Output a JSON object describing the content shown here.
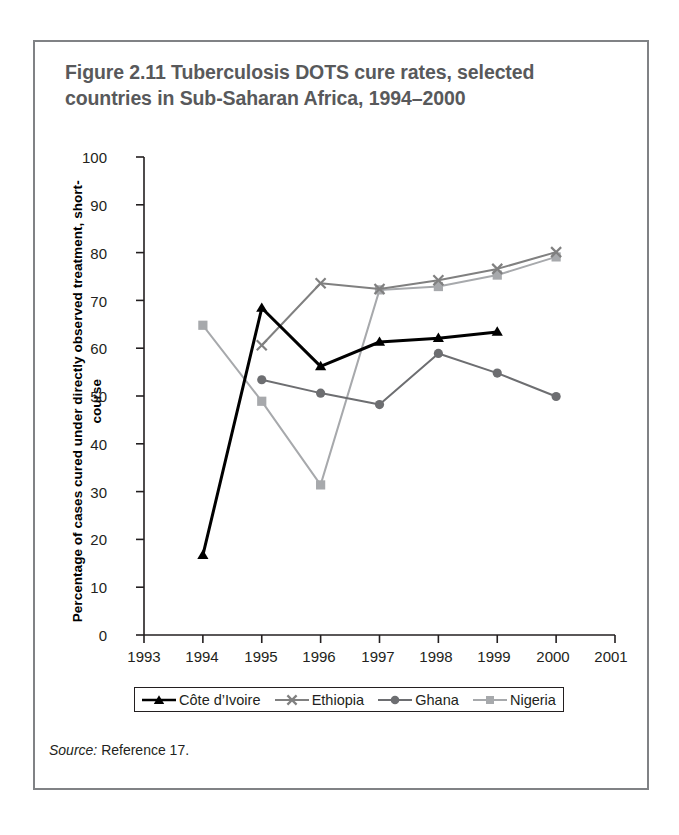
{
  "figure": {
    "title": "Figure 2.11  Tuberculosis DOTS cure rates, selected countries in Sub-Saharan Africa, 1994–2000",
    "source_label": "Source:",
    "source_text": " Reference 17."
  },
  "legend": {
    "items": [
      {
        "label": "Côte d’Ivoire",
        "marker": "triangle-marker-icon",
        "color": "#000000"
      },
      {
        "label": "Ethiopia",
        "marker": "x-marker-icon",
        "color": "#808080"
      },
      {
        "label": "Ghana",
        "marker": "circle-marker-icon",
        "color": "#6d6e71"
      },
      {
        "label": "Nigeria",
        "marker": "square-marker-icon",
        "color": "#a7a9ac"
      }
    ]
  },
  "axes": {
    "y_title": "Percentage of cases cured under directly observed treatment, short-course",
    "y_ticks": [
      "0",
      "10",
      "20",
      "30",
      "40",
      "50",
      "60",
      "70",
      "80",
      "90",
      "100"
    ],
    "x_ticks": [
      "1993",
      "1994",
      "1995",
      "1996",
      "1997",
      "1998",
      "1999",
      "2000",
      "2001"
    ]
  },
  "chart_data": {
    "type": "line",
    "title": "Figure 2.11  Tuberculosis DOTS cure rates, selected countries in Sub-Saharan Africa, 1994–2000",
    "xlabel": "",
    "ylabel": "Percentage of cases cured under directly observed treatment, short-course",
    "xlim": [
      1993,
      2001
    ],
    "ylim": [
      0,
      100
    ],
    "ytick_step": 10,
    "grid": false,
    "legend_position": "bottom",
    "x": [
      1994,
      1995,
      1996,
      1997,
      1998,
      1999,
      2000
    ],
    "series": [
      {
        "name": "Côte d’Ivoire",
        "color": "#000000",
        "marker": "triangle",
        "x": [
          1994,
          1995,
          1996,
          1997,
          1998,
          1999
        ],
        "values": [
          16.7,
          68.4,
          56.2,
          61.3,
          62.1,
          63.4
        ]
      },
      {
        "name": "Ethiopia",
        "color": "#808080",
        "marker": "x",
        "x": [
          1995,
          1996,
          1997,
          1998,
          1999,
          2000
        ],
        "values": [
          60.6,
          73.6,
          72.4,
          74.2,
          76.6,
          80.1
        ]
      },
      {
        "name": "Ghana",
        "color": "#6d6e71",
        "marker": "circle",
        "x": [
          1995,
          1996,
          1997,
          1998,
          1999,
          2000
        ],
        "values": [
          53.4,
          50.6,
          48.2,
          58.9,
          54.8,
          49.9
        ]
      },
      {
        "name": "Nigeria",
        "color": "#a7a9ac",
        "marker": "square",
        "x": [
          1994,
          1995,
          1996,
          1997,
          1998,
          1999,
          2000
        ],
        "values": [
          64.8,
          48.9,
          31.4,
          72.2,
          72.9,
          75.3,
          79.1
        ]
      }
    ]
  }
}
